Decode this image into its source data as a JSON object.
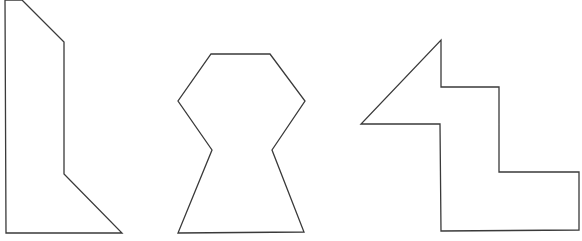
{
  "canvas": {
    "width": 582,
    "height": 241,
    "background": "#ffffff",
    "stroke": "#3a3a3a"
  },
  "shapes": [
    {
      "name": "shape-left-tall-polygon",
      "points": "5,0 22,0 64,42 64,174 122,233 6,233"
    },
    {
      "name": "shape-middle-hourglass-polygon",
      "points": "211,54 270,54 305,101 272,150 304,232 178,233 212,150 178,101"
    },
    {
      "name": "shape-right-stepped-arrow-polygon",
      "points": "441,40 441,87 499,87 499,172 579,172 579,230 441,231 440,124 361,124"
    }
  ]
}
